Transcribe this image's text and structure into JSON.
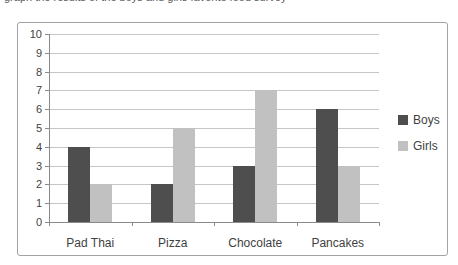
{
  "top_text_fragment": "graph the results of the boys and girls favorite food survey",
  "chart_style": {
    "frame_border_color": "#a3a3a3",
    "gridline_color": "#c6c6c6",
    "axis_color": "#8a8a8a",
    "text_color": "#3f3f3f",
    "background": "#ffffff"
  },
  "chart_data": {
    "type": "bar",
    "title": "",
    "xlabel": "",
    "ylabel": "",
    "categories": [
      "Pad Thai",
      "Pizza",
      "Chocolate",
      "Pancakes"
    ],
    "series": [
      {
        "name": "Boys",
        "color": "#4e4e4e",
        "values": [
          4,
          2,
          3,
          6
        ]
      },
      {
        "name": "Girls",
        "color": "#c1c1c1",
        "values": [
          2,
          5,
          7,
          3
        ]
      }
    ],
    "ylim": [
      0,
      10
    ],
    "ytick_step": 1,
    "grid": true,
    "legend_position": "right",
    "legend": [
      "Boys",
      "Girls"
    ]
  }
}
